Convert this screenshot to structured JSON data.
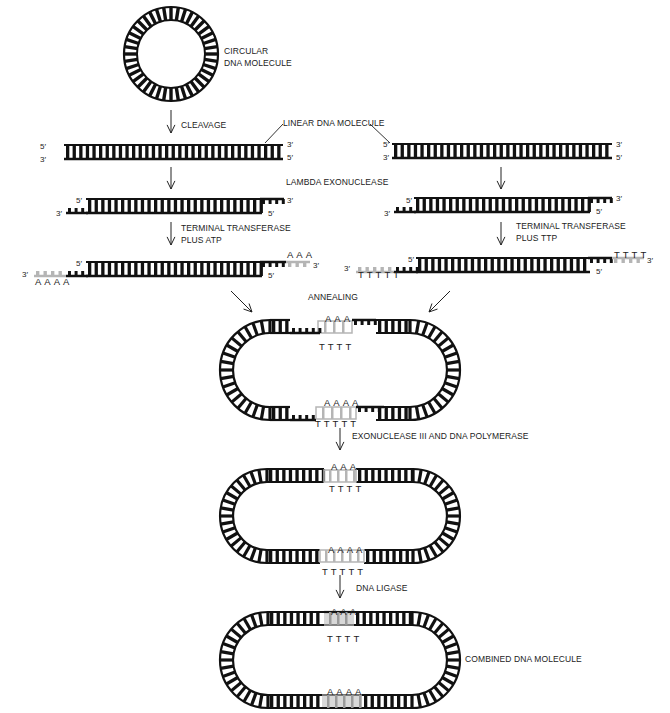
{
  "figure": {
    "colors": {
      "strand": "#111111",
      "tail": "#b5b5b5",
      "background": "#ffffff"
    }
  },
  "labels": {
    "circular": [
      "CIRCULAR",
      "DNA MOLECULE"
    ],
    "cleavage": "CLEAVAGE",
    "linear": "LINEAR DNA  MOLECULE",
    "lambda": "LAMBDA EXONUCLEASE",
    "tt_atp": [
      "TERMINAL TRANSFERASE",
      "PLUS ATP"
    ],
    "tt_ttp": [
      "TERMINAL TRANSFERASE",
      "PLUS TTP"
    ],
    "annealing": "ANNEALING",
    "exo3": "EXONUCLEASE III AND DNA POLYMERASE",
    "ligase": "DNA LIGASE",
    "combined": "COMBINED DNA MOLECULE"
  },
  "ends": {
    "five": "5′",
    "three": "3′"
  },
  "bases": {
    "a3": "AAA",
    "a4": "AAAA",
    "t4": "TTTT",
    "t5": "TTTTT"
  }
}
